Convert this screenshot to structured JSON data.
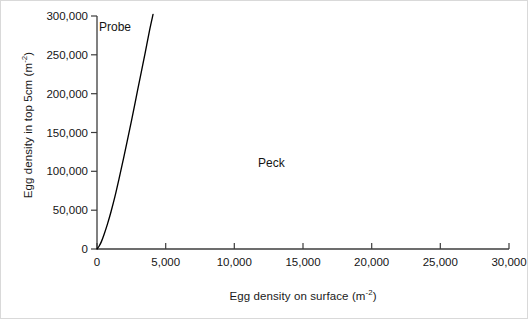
{
  "chart_data": {
    "type": "line",
    "title": "",
    "xlabel_main": "Egg density on surface (m",
    "xlabel_exp": "-2",
    "xlabel_close": ")",
    "ylabel_main": "Egg density in top 5cm (m",
    "ylabel_exp": "-2",
    "ylabel_close": ")",
    "xlim": [
      0,
      30000
    ],
    "ylim": [
      0,
      300000
    ],
    "xticks": [
      0,
      5000,
      10000,
      15000,
      20000,
      25000,
      30000
    ],
    "xtick_labels": [
      "0",
      "5,000",
      "10,000",
      "15,000",
      "20,000",
      "25,000",
      "30,000"
    ],
    "yticks": [
      0,
      50000,
      100000,
      150000,
      200000,
      250000,
      300000
    ],
    "ytick_labels": [
      "0",
      "50,000",
      "100,000",
      "150,000",
      "200,000",
      "250,000",
      "300,000"
    ],
    "grid": false,
    "legend_position": "inline-annotations",
    "series": [
      {
        "name": "Probe",
        "color": "#000000",
        "x": [
          0,
          150,
          320,
          520,
          760,
          1020,
          1300,
          1600,
          1900,
          2200,
          2520,
          2850,
          3180,
          3500,
          3820,
          4080
        ],
        "values": [
          0,
          3500,
          9500,
          19000,
          32000,
          48000,
          67000,
          90000,
          114000,
          139000,
          166000,
          195000,
          224000,
          252000,
          281000,
          302000
        ]
      },
      {
        "name": "Peck",
        "color": "#000000",
        "x": [
          0,
          30000
        ],
        "values": [
          0,
          0
        ],
        "note": "flat along x-axis, labelled in plot area"
      }
    ],
    "annotations": [
      {
        "text": "Probe",
        "x": 200,
        "y": 283000
      },
      {
        "text": "Peck",
        "x": 11800,
        "y": 113000
      }
    ]
  }
}
